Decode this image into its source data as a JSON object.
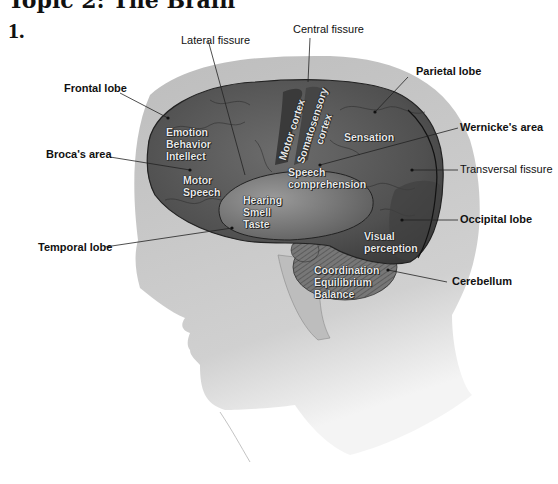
{
  "header": {
    "partial_title": "Topic 2: The Brain",
    "item_number": "1."
  },
  "callouts": {
    "lateral_fissure": "Lateral fissure",
    "central_fissure": "Central fissure",
    "frontal_lobe": "Frontal lobe",
    "parietal_lobe": "Parietal lobe",
    "wernickes_area": "Wernicke's area",
    "brocas_area": "Broca's area",
    "transversal_fissure": "Transversal fissure",
    "occipital_lobe": "Occipital lobe",
    "temporal_lobe": "Temporal lobe",
    "cerebellum": "Cerebellum"
  },
  "regions": {
    "frontal": [
      "Emotion",
      "Behavior",
      "Intellect"
    ],
    "broca": [
      "Motor",
      "Speech"
    ],
    "motor_cortex": "Motor cortex",
    "somatosensory": [
      "Somatosensory",
      "cortex"
    ],
    "sensation": "Sensation",
    "speech_comp": [
      "Speech",
      "comprehension"
    ],
    "temporal": [
      "Hearing",
      "Smell",
      "Taste"
    ],
    "visual": [
      "Visual",
      "perception"
    ],
    "cerebellum": [
      "Coordination",
      "Equilibrium",
      "Balance"
    ]
  },
  "colors": {
    "head": "#c8c8c8",
    "skull": "#b4b4b4",
    "brain": "#5a5a5a",
    "brain_dark": "#3c3c3c",
    "temporal": "#7a7a7a"
  }
}
